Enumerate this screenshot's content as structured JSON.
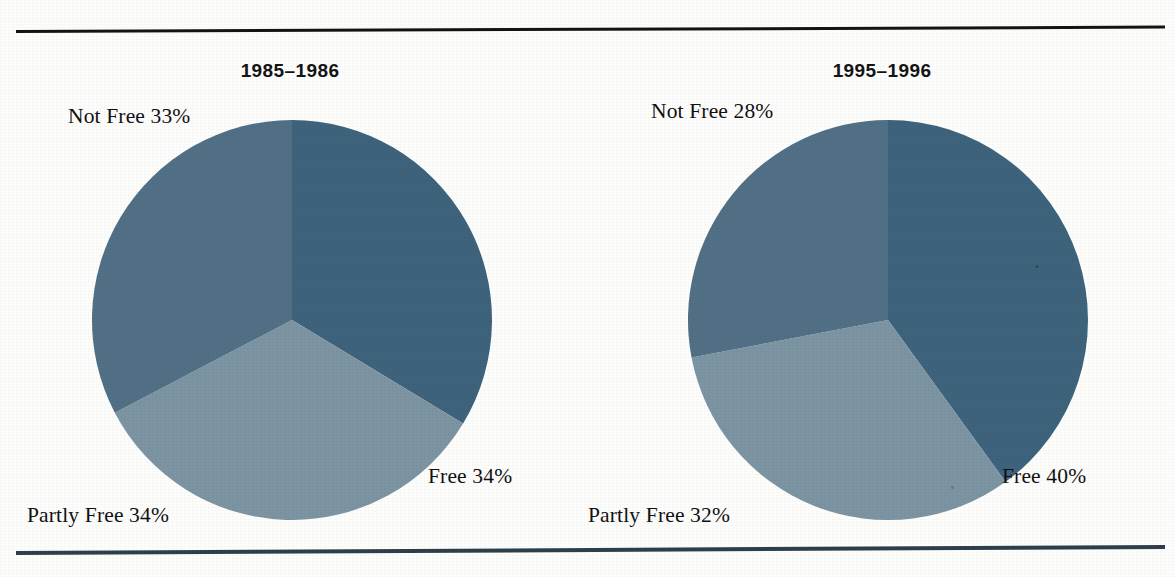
{
  "figure": {
    "background_color": "#fdfdfc",
    "rule_color_top": "#141414",
    "rule_color_bottom": "#2e3f4c"
  },
  "palette": {
    "free": "#3e637c",
    "partly_free": "#7d94a3",
    "not_free": "#517086"
  },
  "panels": [
    {
      "id": "panel-1985-1986",
      "title": "1985–1986",
      "labels": {
        "not_free": "Not Free 33%",
        "partly_free": "Partly Free 34%",
        "free": "Free 34%"
      }
    },
    {
      "id": "panel-1995-1996",
      "title": "1995–1996",
      "labels": {
        "not_free": "Not Free 28%",
        "partly_free": "Partly Free 32%",
        "free": "Free 40%"
      }
    }
  ],
  "chart_data": [
    {
      "type": "pie",
      "title": "1985–1986",
      "categories": [
        "Free",
        "Partly Free",
        "Not Free"
      ],
      "values": [
        34,
        34,
        33
      ],
      "unit": "%",
      "colors": [
        "#3e637c",
        "#7d94a3",
        "#517086"
      ],
      "labels": [
        "Free 34%",
        "Partly Free 34%",
        "Not Free 33%"
      ],
      "start_angle_deg": 0,
      "direction": "clockwise",
      "legend": "none",
      "grid": false
    },
    {
      "type": "pie",
      "title": "1995–1996",
      "categories": [
        "Free",
        "Partly Free",
        "Not Free"
      ],
      "values": [
        40,
        32,
        28
      ],
      "unit": "%",
      "colors": [
        "#3e637c",
        "#7d94a3",
        "#517086"
      ],
      "labels": [
        "Free 40%",
        "Partly Free 32%",
        "Not Free 28%"
      ],
      "start_angle_deg": 0,
      "direction": "clockwise",
      "legend": "none",
      "grid": false
    }
  ]
}
